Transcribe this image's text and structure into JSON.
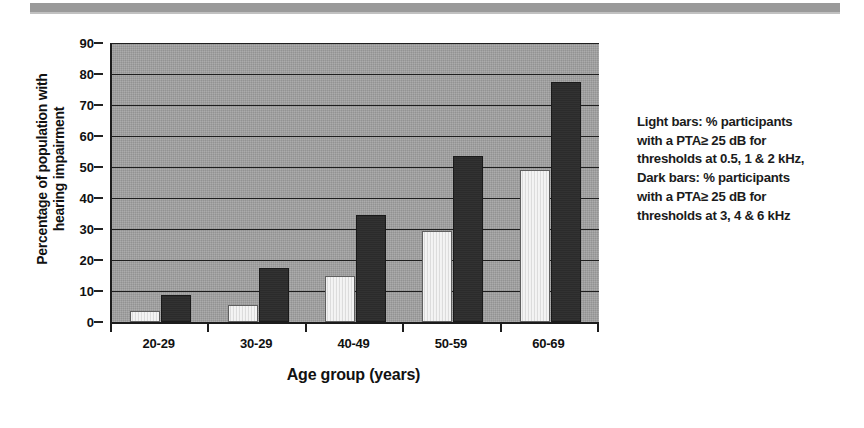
{
  "figure": {
    "ylabel": "Percentage of population with hearing impairment",
    "xlabel": "Age group (years)"
  },
  "legend_note": {
    "lines": [
      "Light bars: % participants",
      "with a PTA≥ 25 dB for",
      "thresholds at 0.5, 1 & 2 kHz,",
      "Dark bars: % participants",
      "with a PTA≥ 25 dB for",
      "thresholds at 3, 4 & 6 kHz"
    ]
  },
  "chart_data": {
    "type": "bar",
    "title": "",
    "xlabel": "Age group (years)",
    "ylabel": "Percentage of population with hearing impairment",
    "categories": [
      "20-29",
      "30-29",
      "40-49",
      "50-59",
      "60-69"
    ],
    "ylim": [
      0,
      90
    ],
    "yticks": [
      0,
      10,
      20,
      30,
      40,
      50,
      60,
      70,
      80,
      90
    ],
    "grid": true,
    "legend_position": "right-text-block",
    "series": [
      {
        "name": "Light bars: % participants with a PTA≥ 25 dB for thresholds at 0.5, 1 & 2 kHz",
        "color": "#f0f0f0",
        "values": [
          3.5,
          5.5,
          15.0,
          29.5,
          49.0
        ]
      },
      {
        "name": "Dark bars: % participants with a PTA≥ 25 dB for thresholds at 3, 4 & 6 kHz",
        "color": "#2e2e2e",
        "values": [
          8.7,
          17.5,
          34.5,
          53.5,
          77.5
        ]
      }
    ]
  },
  "colors": {
    "plot_background": "#a3a3a3",
    "gridline": "#1e1e1e",
    "axis": "#1c1c1c",
    "light_bar": "#f0f0f0",
    "dark_bar": "#2e2e2e",
    "scan_artifact": "#8d8d8d"
  }
}
